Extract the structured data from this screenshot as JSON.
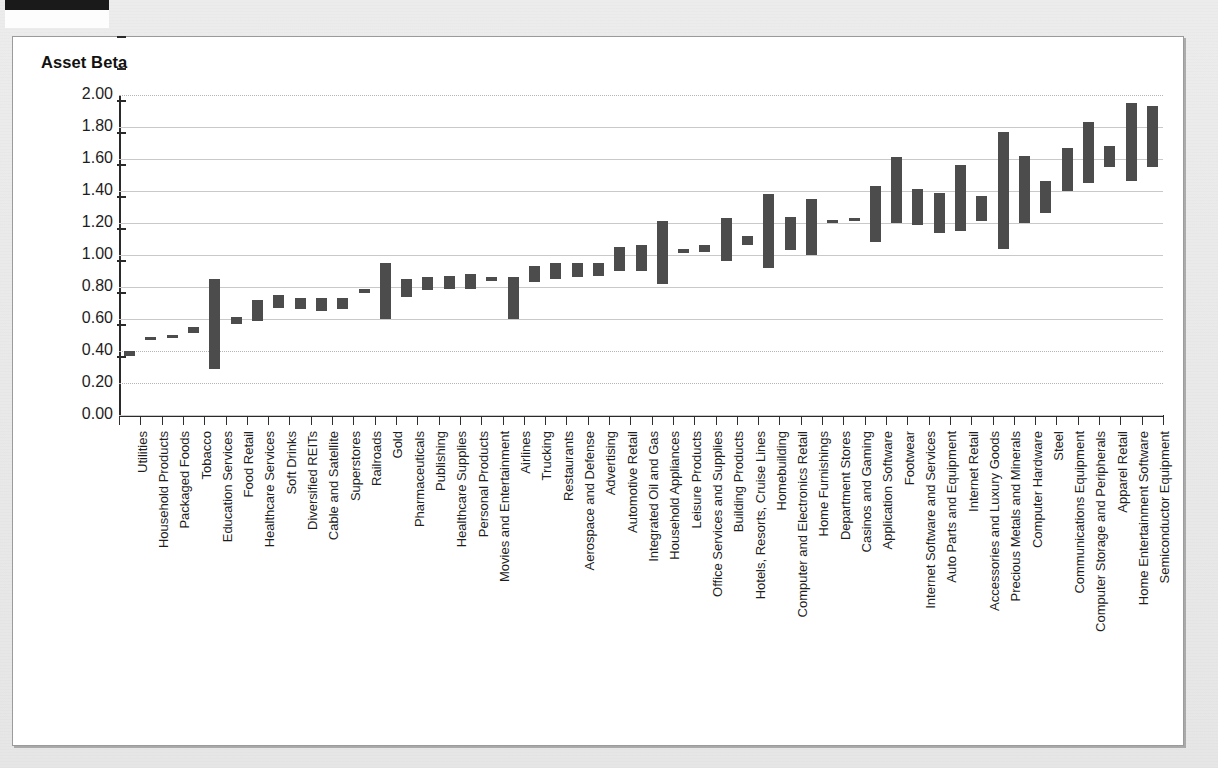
{
  "page": {
    "background_color": "#e8e8e8",
    "panel_color": "#ffffff",
    "marker_bar_color": "#1a1a1a"
  },
  "chart_data": {
    "type": "bar",
    "subtype": "floating-range-bar",
    "title": "Asset Beta",
    "xlabel": "",
    "ylabel": "Asset Beta",
    "ylim": [
      0.0,
      2.0
    ],
    "ytick_step": 0.2,
    "ytick_labels": [
      "2.00",
      "1.80",
      "1.60",
      "1.40",
      "1.20",
      "1.00",
      "0.80",
      "0.60",
      "0.40",
      "0.20",
      "0.00"
    ],
    "ytick_values": [
      2.0,
      1.8,
      1.6,
      1.4,
      1.2,
      1.0,
      0.8,
      0.6,
      0.4,
      0.2,
      0.0
    ],
    "grid": true,
    "legend": "none",
    "bar_color": "#4c4c4c",
    "categories": [
      "Utilities",
      "Household Products",
      "Packaged Foods",
      "Tobacco",
      "Education Services",
      "Food Retail",
      "Healthcare Services",
      "Soft Drinks",
      "Diversified REITs",
      "Cable and Satellite",
      "Superstores",
      "Railroads",
      "Gold",
      "Pharmaceuticals",
      "Publishing",
      "Healthcare Supplies",
      "Personal Products",
      "Movies and Entertainment",
      "Airlines",
      "Trucking",
      "Restaurants",
      "Aerospace and Defense",
      "Advertising",
      "Automotive Retail",
      "Integrated Oil and Gas",
      "Household Appliances",
      "Leisure Products",
      "Office Services and Supplies",
      "Building Products",
      "Hotels, Resorts, Cruise Lines",
      "Homebuilding",
      "Computer and Electronics Retail",
      "Home Furnishings",
      "Department Stores",
      "Casinos and Gaming",
      "Application Software",
      "Footwear",
      "Internet Software and Services",
      "Auto Parts and Equipment",
      "Internet Retail",
      "Accessories and Luxury Goods",
      "Precious Metals and Minerals",
      "Computer Hardware",
      "Steel",
      "Communications Equipment",
      "Computer Storage and Peripherals",
      "Apparel Retail",
      "Home Entertainment Software",
      "Semiconductor Equipment"
    ],
    "low": [
      0.37,
      0.48,
      0.49,
      0.51,
      0.29,
      0.57,
      0.59,
      0.67,
      0.66,
      0.65,
      0.66,
      0.76,
      0.6,
      0.74,
      0.78,
      0.79,
      0.79,
      0.84,
      0.6,
      0.83,
      0.85,
      0.86,
      0.87,
      0.9,
      0.9,
      0.82,
      1.01,
      1.02,
      0.96,
      1.06,
      0.92,
      1.03,
      1.0,
      1.21,
      1.21,
      1.08,
      1.2,
      1.19,
      1.14,
      1.15,
      1.21,
      1.04,
      1.2,
      1.26,
      1.4,
      1.45,
      1.55,
      1.46,
      1.55
    ],
    "high": [
      0.4,
      0.49,
      0.5,
      0.55,
      0.85,
      0.61,
      0.72,
      0.75,
      0.73,
      0.73,
      0.73,
      0.79,
      0.95,
      0.85,
      0.86,
      0.87,
      0.88,
      0.86,
      0.86,
      0.93,
      0.95,
      0.95,
      0.95,
      1.05,
      1.06,
      1.21,
      1.04,
      1.06,
      1.23,
      1.12,
      1.38,
      1.24,
      1.35,
      1.22,
      1.23,
      1.43,
      1.61,
      1.41,
      1.39,
      1.56,
      1.37,
      1.77,
      1.62,
      1.46,
      1.67,
      1.83,
      1.68,
      1.95,
      1.93
    ]
  }
}
